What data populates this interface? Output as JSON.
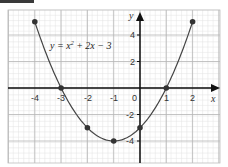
{
  "chart_data": {
    "type": "line",
    "title": "",
    "equation_label": "y = x² + 2x − 3",
    "xlabel": "x",
    "ylabel": "y",
    "xlim": [
      -5,
      2.5
    ],
    "ylim": [
      -5.8,
      6
    ],
    "x_ticks": [
      -4,
      -3,
      -2,
      -1,
      0,
      1,
      2
    ],
    "x_tick_labels": [
      "-4",
      "-3",
      "-2",
      "-1",
      "0",
      "1",
      "2"
    ],
    "y_ticks": [
      4,
      2,
      -2,
      -4
    ],
    "y_tick_labels": [
      "4",
      "2",
      "-2",
      "-4"
    ],
    "grid": true,
    "legend": "none",
    "series": [
      {
        "name": "y = x^2 + 2x - 3",
        "x": [
          -4,
          -3,
          -2,
          -1,
          0,
          1,
          2
        ],
        "y": [
          5,
          0,
          -3,
          -4,
          -3,
          0,
          5
        ],
        "markers": true
      }
    ]
  },
  "labels": {
    "equation_prefix": "y = x",
    "equation_exp": "2",
    "equation_suffix": " + 2x − 3",
    "x_axis": "x",
    "y_axis": "y",
    "origin": "0",
    "x_ticks": [
      "-4",
      "-3",
      "-2",
      "-1",
      "1",
      "2"
    ],
    "y_ticks": [
      "4",
      "2",
      "-2",
      "-4"
    ]
  }
}
